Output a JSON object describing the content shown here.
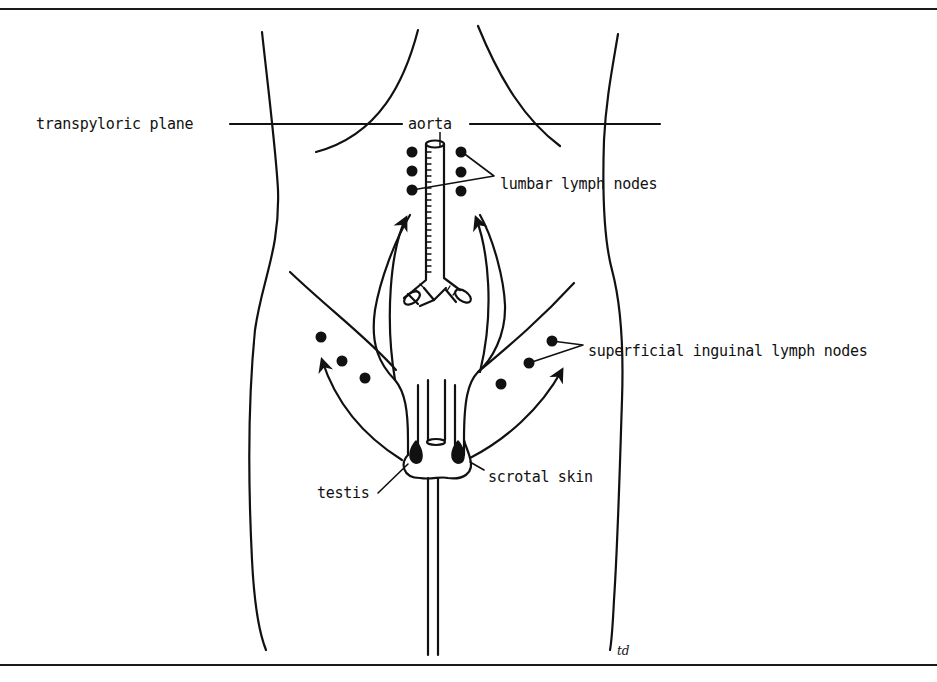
{
  "figure": {
    "type": "anatomical line diagram",
    "labels": {
      "transpyloric_plane": "transpyloric plane",
      "aorta": "aorta",
      "lumbar_lymph_nodes": "lumbar lymph nodes",
      "superficial_inguinal_lymph_nodes": "superficial inguinal lymph nodes",
      "testis": "testis",
      "scrotal_skin": "scrotal skin"
    },
    "signature": "td",
    "colors": {
      "ink": "#111111",
      "background": "#ffffff"
    }
  }
}
